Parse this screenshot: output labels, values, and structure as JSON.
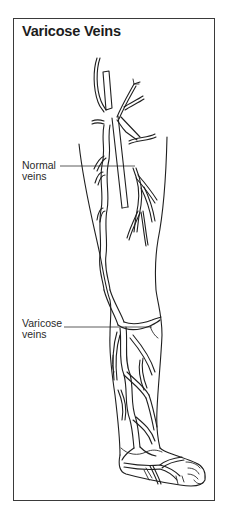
{
  "figure": {
    "title": "Varicose Veins",
    "labels": {
      "normal": {
        "line1": "Normal",
        "line2": "veins"
      },
      "varicose": {
        "line1": "Varicose",
        "line2": "veins"
      }
    },
    "colors": {
      "ink": "#1f1f1f",
      "border": "#3a3a3a",
      "background": "#ffffff"
    }
  }
}
